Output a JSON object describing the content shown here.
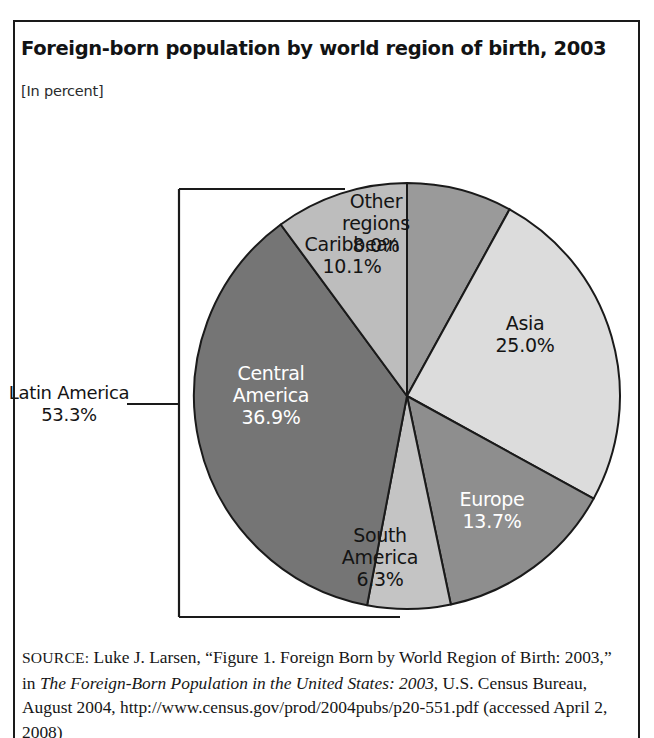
{
  "figure": {
    "header_label": "FIGURE 1.1",
    "title": "Foreign-born population by world region of birth, 2003",
    "subtitle": "[In percent]"
  },
  "bracket": {
    "label_name": "Latin America",
    "label_value": "53.3%"
  },
  "source": {
    "keyword": "SOURCE:",
    "line_1": " Luke J. Larsen, “Figure 1. Foreign Born by World Region of Birth: 2003,” in ",
    "italic_1": "The Foreign-Born Population in the United States: 2003",
    "line_2": ", U.S. Census Bureau, August 2004, http://www.census.gov/prod/2004pubs/p20-551.pdf (accessed April 2, 2008)"
  },
  "colors": {
    "other_regions": "#9a9a9a",
    "asia": "#dcdcdc",
    "europe": "#8e8e8e",
    "south_america": "#c4c4c4",
    "central_america": "#757575",
    "caribbean": "#bdbdbd",
    "outline": "#1a1a1a",
    "text_dark": "#141414",
    "text_light": "#ffffff"
  },
  "chart_data": {
    "type": "pie",
    "title": "Foreign-born population by world region of birth, 2003",
    "subtitle": "[In percent]",
    "unit": "percent",
    "start_angle_deg": 0,
    "direction": "clockwise",
    "legend": "none (labels inside slices)",
    "categories": [
      "Other regions",
      "Asia",
      "Europe",
      "South America",
      "Central America",
      "Caribbean"
    ],
    "values": [
      8.0,
      25.0,
      13.7,
      6.3,
      36.9,
      10.1
    ],
    "slices": [
      {
        "label": "Other regions",
        "value": 8.0,
        "value_text": "8.0%",
        "label_text": "Other\nregions\n8.0%",
        "fill": "#9a9a9a",
        "text_color": "#141414"
      },
      {
        "label": "Asia",
        "value": 25.0,
        "value_text": "25.0%",
        "label_text": "Asia\n25.0%",
        "fill": "#dcdcdc",
        "text_color": "#141414"
      },
      {
        "label": "Europe",
        "value": 13.7,
        "value_text": "13.7%",
        "label_text": "Europe\n13.7%",
        "fill": "#8e8e8e",
        "text_color": "#ffffff"
      },
      {
        "label": "South America",
        "value": 6.3,
        "value_text": "6.3%",
        "label_text": "South\nAmerica\n6.3%",
        "fill": "#c4c4c4",
        "text_color": "#141414"
      },
      {
        "label": "Central America",
        "value": 36.9,
        "value_text": "36.9%",
        "label_text": "Central\nAmerica\n36.9%",
        "fill": "#757575",
        "text_color": "#ffffff"
      },
      {
        "label": "Caribbean",
        "value": 10.1,
        "value_text": "10.1%",
        "label_text": "Caribbean\n10.1%",
        "fill": "#bdbdbd",
        "text_color": "#141414"
      }
    ],
    "groups": [
      {
        "label": "Latin America",
        "value": 53.3,
        "value_text": "53.3%",
        "label_text": "Latin America\n53.3%",
        "members": [
          "Central America",
          "South America",
          "Caribbean"
        ]
      }
    ]
  }
}
